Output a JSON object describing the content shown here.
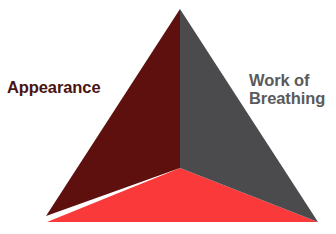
{
  "diagram": {
    "name": "pediatric-assessment-triangle",
    "type": "3d-pyramid",
    "background_color": "#ffffff",
    "faces": [
      {
        "id": "left-face",
        "name": "appearance-face",
        "color": "#5d100e",
        "points": "180,9 46,216 180,168"
      },
      {
        "id": "right-face",
        "name": "work-of-breathing-face",
        "color": "#4b4b4d",
        "points": "180,9 318,222 180,168"
      },
      {
        "id": "bottom-face",
        "name": "circulation-face",
        "color": "#fa3a3a",
        "points": "180,168 47,222 318,222"
      }
    ],
    "apex": {
      "x": 180,
      "y": 9
    },
    "center_vertex": {
      "x": 180,
      "y": 168
    },
    "bottom_left_vertex": {
      "x": 46,
      "y": 216
    },
    "bottom_right_vertex": {
      "x": 318,
      "y": 222
    }
  },
  "labels": {
    "appearance": {
      "text": "Appearance",
      "color": "#4a1412"
    },
    "work_of_breathing": {
      "text": "Work of\nBreathing",
      "color": "#5a5a5c"
    }
  }
}
